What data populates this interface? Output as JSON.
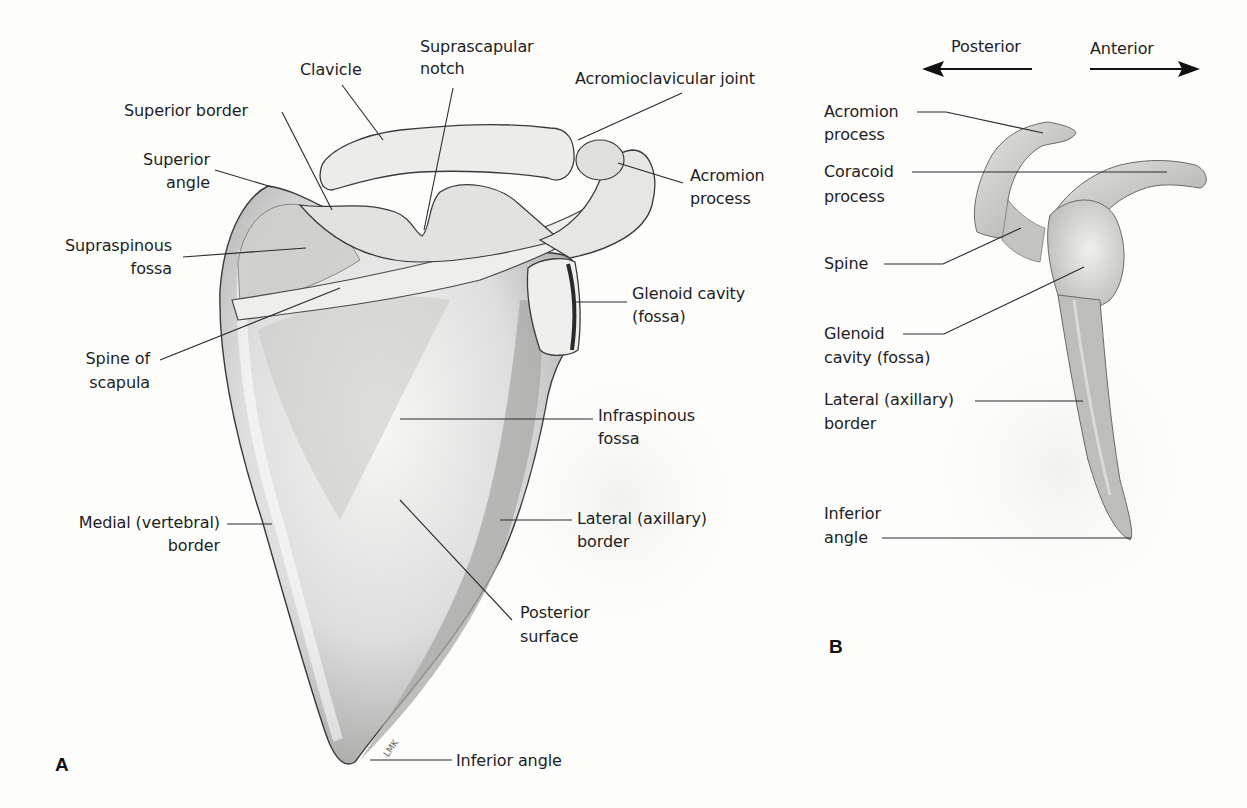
{
  "figure": {
    "panel_a": {
      "letter": "A",
      "labels": {
        "clavicle": "Clavicle",
        "suprascapular_notch_1": "Suprascapular",
        "suprascapular_notch_2": "notch",
        "acromioclavicular_joint": "Acromioclavicular joint",
        "superior_border": "Superior border",
        "superior_angle_1": "Superior",
        "superior_angle_2": "angle",
        "acromion_process_1": "Acromion",
        "acromion_process_2": "process",
        "supraspinous_fossa_1": "Supraspinous",
        "supraspinous_fossa_2": "fossa",
        "glenoid_cavity_1": "Glenoid cavity",
        "glenoid_cavity_2": "(fossa)",
        "spine_of_scapula_1": "Spine of",
        "spine_of_scapula_2": "scapula",
        "infraspinous_fossa_1": "Infraspinous",
        "infraspinous_fossa_2": "fossa",
        "medial_border_1": "Medial (vertebral)",
        "medial_border_2": "border",
        "lateral_border_1": "Lateral (axillary)",
        "lateral_border_2": "border",
        "posterior_surface_1": "Posterior",
        "posterior_surface_2": "surface",
        "inferior_angle": "Inferior angle",
        "signature": "LMK"
      }
    },
    "panel_b": {
      "letter": "B",
      "direction": {
        "left": "Posterior",
        "right": "Anterior"
      },
      "labels": {
        "acromion_process_1": "Acromion",
        "acromion_process_2": "process",
        "coracoid_process_1": "Coracoid",
        "coracoid_process_2": "process",
        "spine": "Spine",
        "glenoid_cavity_1": "Glenoid",
        "glenoid_cavity_2": "cavity (fossa)",
        "lateral_border_1": "Lateral (axillary)",
        "lateral_border_2": "border",
        "inferior_angle_1": "Inferior",
        "inferior_angle_2": "angle"
      }
    },
    "colors": {
      "background": "#fdfdfc",
      "bone_light": "#f2f2f0",
      "bone_mid": "#c9c9c6",
      "bone_dark": "#8d8d8a",
      "outline": "#3a3a3a",
      "leader_line": "#2a2a2a"
    }
  }
}
